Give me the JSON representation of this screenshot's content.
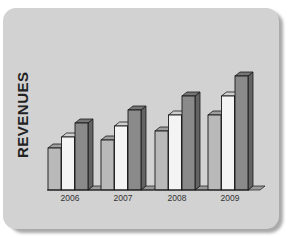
{
  "chart_data": {
    "type": "bar",
    "style": "3d-clustered",
    "title": "",
    "xlabel": "",
    "ylabel": "REVENUES",
    "categories": [
      "2006",
      "2007",
      "2008",
      "2009"
    ],
    "series": [
      {
        "name": "Series 1",
        "color": "#b9b9b9",
        "values": [
          42,
          50,
          59,
          75
        ]
      },
      {
        "name": "Series 2",
        "color": "#f4f4f4",
        "values": [
          53,
          64,
          75,
          94
        ]
      },
      {
        "name": "Series 3",
        "color": "#8a8a8a",
        "values": [
          67,
          80,
          94,
          114
        ]
      }
    ],
    "ylim": [
      0,
      120
    ],
    "grid": false,
    "legend": "none"
  },
  "colors": {
    "card_background": "#d2d2d2",
    "card_shadow": "#a9a9a9",
    "outline": "#1a1a1a"
  }
}
